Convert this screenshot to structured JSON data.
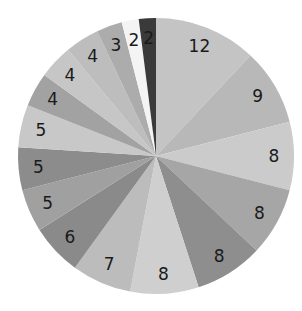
{
  "chart_data": {
    "type": "pie",
    "title": "",
    "start_angle": "12 o'clock",
    "direction": "clockwise",
    "labels_shown": "values",
    "values": [
      12,
      9,
      8,
      8,
      8,
      8,
      7,
      6,
      5,
      5,
      5,
      4,
      4,
      4,
      3,
      2,
      2
    ],
    "colors": [
      "#c4c4c4",
      "#b8b8b8",
      "#cbcbcb",
      "#a6a6a6",
      "#8e8e8e",
      "#cfcfcf",
      "#bcbcbc",
      "#8a8a8a",
      "#a0a0a0",
      "#8c8c8c",
      "#c8c8c8",
      "#a2a2a2",
      "#c6c6c6",
      "#bdbdbd",
      "#acacac",
      "#f4f4f4",
      "#3a3a3a"
    ],
    "label_colors": [
      "#1a1a1a",
      "#1a1a1a",
      "#1a1a1a",
      "#1a1a1a",
      "#1a1a1a",
      "#1a1a1a",
      "#1a1a1a",
      "#1a1a1a",
      "#1a1a1a",
      "#1a1a1a",
      "#1a1a1a",
      "#1a1a1a",
      "#1a1a1a",
      "#1a1a1a",
      "#1a1a1a",
      "#1a1a1a",
      "#ffffff"
    ],
    "total": 100,
    "legend": "none"
  }
}
